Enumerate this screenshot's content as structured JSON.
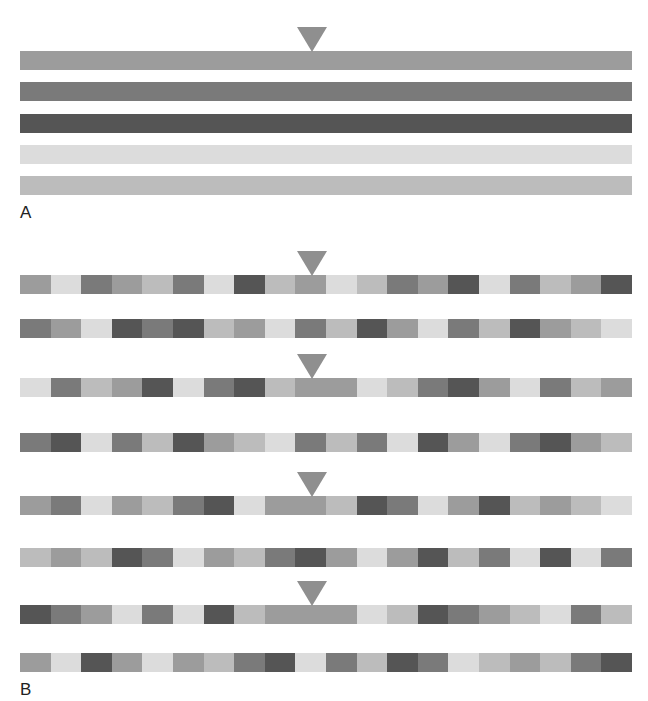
{
  "colors": {
    "light": "#dcdcdc",
    "lightmed": "#bcbcbc",
    "medium": "#9c9c9c",
    "darkmed": "#7a7a7a",
    "dark": "#555555",
    "marker": "#8f8f8f"
  },
  "panel_a": {
    "label": "A",
    "bars": [
      {
        "shade": "medium",
        "marked": true
      },
      {
        "shade": "darkmed",
        "marked": false
      },
      {
        "shade": "dark",
        "marked": false
      },
      {
        "shade": "light",
        "marked": false
      },
      {
        "shade": "lightmed",
        "marked": false
      }
    ]
  },
  "panel_b": {
    "label": "B",
    "rows": [
      {
        "marked": true,
        "segments": [
          [
            "medium",
            1
          ],
          [
            "light",
            1
          ],
          [
            "darkmed",
            1
          ],
          [
            "medium",
            1
          ],
          [
            "lightmed",
            1
          ],
          [
            "darkmed",
            1
          ],
          [
            "light",
            1
          ],
          [
            "dark",
            1
          ],
          [
            "lightmed",
            1
          ],
          [
            "medium",
            1
          ],
          [
            "light",
            1
          ],
          [
            "lightmed",
            1
          ],
          [
            "darkmed",
            1
          ],
          [
            "medium",
            1
          ],
          [
            "dark",
            1
          ],
          [
            "light",
            1
          ],
          [
            "darkmed",
            1
          ],
          [
            "lightmed",
            1
          ],
          [
            "medium",
            1
          ],
          [
            "dark",
            1
          ]
        ]
      },
      {
        "marked": false,
        "segments": [
          [
            "darkmed",
            1
          ],
          [
            "medium",
            1
          ],
          [
            "light",
            1
          ],
          [
            "dark",
            1
          ],
          [
            "darkmed",
            1
          ],
          [
            "dark",
            1
          ],
          [
            "lightmed",
            1
          ],
          [
            "medium",
            1
          ],
          [
            "light",
            1
          ],
          [
            "darkmed",
            1
          ],
          [
            "lightmed",
            1
          ],
          [
            "dark",
            1
          ],
          [
            "medium",
            1
          ],
          [
            "light",
            1
          ],
          [
            "darkmed",
            1
          ],
          [
            "lightmed",
            1
          ],
          [
            "dark",
            1
          ],
          [
            "medium",
            1
          ],
          [
            "lightmed",
            1
          ],
          [
            "light",
            1
          ]
        ]
      },
      {
        "marked": true,
        "segments": [
          [
            "light",
            1
          ],
          [
            "darkmed",
            1
          ],
          [
            "lightmed",
            1
          ],
          [
            "medium",
            1
          ],
          [
            "dark",
            1
          ],
          [
            "light",
            1
          ],
          [
            "darkmed",
            1
          ],
          [
            "dark",
            1
          ],
          [
            "lightmed",
            1
          ],
          [
            "medium",
            2
          ],
          [
            "light",
            1
          ],
          [
            "lightmed",
            1
          ],
          [
            "darkmed",
            1
          ],
          [
            "dark",
            1
          ],
          [
            "medium",
            1
          ],
          [
            "light",
            1
          ],
          [
            "darkmed",
            1
          ],
          [
            "lightmed",
            1
          ],
          [
            "medium",
            1
          ]
        ]
      },
      {
        "marked": false,
        "segments": [
          [
            "darkmed",
            1
          ],
          [
            "dark",
            1
          ],
          [
            "light",
            1
          ],
          [
            "darkmed",
            1
          ],
          [
            "lightmed",
            1
          ],
          [
            "dark",
            1
          ],
          [
            "medium",
            1
          ],
          [
            "lightmed",
            1
          ],
          [
            "light",
            1
          ],
          [
            "darkmed",
            1
          ],
          [
            "lightmed",
            1
          ],
          [
            "darkmed",
            1
          ],
          [
            "light",
            1
          ],
          [
            "dark",
            1
          ],
          [
            "medium",
            1
          ],
          [
            "light",
            1
          ],
          [
            "darkmed",
            1
          ],
          [
            "dark",
            1
          ],
          [
            "medium",
            1
          ],
          [
            "lightmed",
            1
          ]
        ]
      },
      {
        "marked": true,
        "segments": [
          [
            "medium",
            1
          ],
          [
            "darkmed",
            1
          ],
          [
            "light",
            1
          ],
          [
            "medium",
            1
          ],
          [
            "lightmed",
            1
          ],
          [
            "darkmed",
            1
          ],
          [
            "dark",
            1
          ],
          [
            "light",
            1
          ],
          [
            "medium",
            2
          ],
          [
            "lightmed",
            1
          ],
          [
            "dark",
            1
          ],
          [
            "darkmed",
            1
          ],
          [
            "light",
            1
          ],
          [
            "medium",
            1
          ],
          [
            "dark",
            1
          ],
          [
            "lightmed",
            1
          ],
          [
            "medium",
            1
          ],
          [
            "lightmed",
            1
          ],
          [
            "light",
            1
          ]
        ]
      },
      {
        "marked": false,
        "segments": [
          [
            "lightmed",
            1
          ],
          [
            "medium",
            1
          ],
          [
            "lightmed",
            1
          ],
          [
            "dark",
            1
          ],
          [
            "darkmed",
            1
          ],
          [
            "light",
            1
          ],
          [
            "medium",
            1
          ],
          [
            "lightmed",
            1
          ],
          [
            "darkmed",
            1
          ],
          [
            "dark",
            1
          ],
          [
            "medium",
            1
          ],
          [
            "light",
            1
          ],
          [
            "medium",
            1
          ],
          [
            "dark",
            1
          ],
          [
            "lightmed",
            1
          ],
          [
            "darkmed",
            1
          ],
          [
            "light",
            1
          ],
          [
            "dark",
            1
          ],
          [
            "light",
            1
          ],
          [
            "darkmed",
            1
          ]
        ]
      },
      {
        "marked": true,
        "segments": [
          [
            "dark",
            1
          ],
          [
            "darkmed",
            1
          ],
          [
            "medium",
            1
          ],
          [
            "light",
            1
          ],
          [
            "darkmed",
            1
          ],
          [
            "light",
            1
          ],
          [
            "dark",
            1
          ],
          [
            "lightmed",
            1
          ],
          [
            "medium",
            3
          ],
          [
            "light",
            1
          ],
          [
            "lightmed",
            1
          ],
          [
            "dark",
            1
          ],
          [
            "darkmed",
            1
          ],
          [
            "medium",
            1
          ],
          [
            "lightmed",
            1
          ],
          [
            "light",
            1
          ],
          [
            "darkmed",
            1
          ],
          [
            "lightmed",
            1
          ]
        ]
      },
      {
        "marked": false,
        "segments": [
          [
            "medium",
            1
          ],
          [
            "light",
            1
          ],
          [
            "dark",
            1
          ],
          [
            "medium",
            1
          ],
          [
            "light",
            1
          ],
          [
            "medium",
            1
          ],
          [
            "lightmed",
            1
          ],
          [
            "darkmed",
            1
          ],
          [
            "dark",
            1
          ],
          [
            "light",
            1
          ],
          [
            "darkmed",
            1
          ],
          [
            "lightmed",
            1
          ],
          [
            "dark",
            1
          ],
          [
            "darkmed",
            1
          ],
          [
            "light",
            1
          ],
          [
            "lightmed",
            1
          ],
          [
            "medium",
            1
          ],
          [
            "lightmed",
            1
          ],
          [
            "darkmed",
            1
          ],
          [
            "dark",
            1
          ]
        ]
      }
    ]
  }
}
